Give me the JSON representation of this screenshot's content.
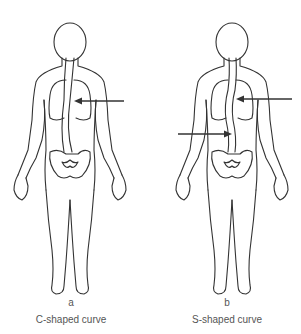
{
  "figures": [
    {
      "letter": "a",
      "caption": "C-shaped curve",
      "arrows": 1,
      "view": "posterior body outline with spine"
    },
    {
      "letter": "b",
      "caption": "S-shaped curve",
      "arrows": 2,
      "view": "posterior body outline with spine"
    }
  ],
  "colors": {
    "line": "#333333",
    "text": "#555555",
    "background": "#ffffff"
  }
}
